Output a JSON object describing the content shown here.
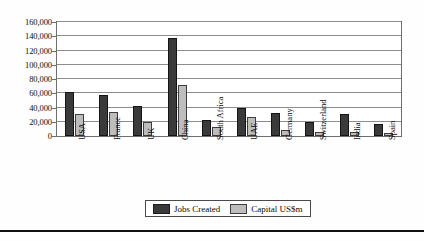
{
  "chart_data": {
    "type": "bar",
    "title": "",
    "subtitle": "",
    "xlabel": "",
    "ylabel": "",
    "ylim": [
      0,
      160000
    ],
    "ytick_step": 20000,
    "ytick_labels": [
      "0",
      "20,000",
      "40,000",
      "60,000",
      "80,000",
      "100,000",
      "120,000",
      "140,000",
      "160,000"
    ],
    "ytick_values": [
      0,
      20000,
      40000,
      60000,
      80000,
      100000,
      120000,
      140000,
      160000
    ],
    "grid": true,
    "grid_axis": "y",
    "legend_position": "bottom",
    "categories": [
      "USA",
      "France",
      "UK",
      "China",
      "South Africa",
      "UAE",
      "Germany",
      "Switzerland",
      "India",
      "Spain"
    ],
    "series": [
      {
        "name": "Jobs Created",
        "color": "#3a3a3a",
        "values": [
          62000,
          58000,
          42000,
          138000,
          22000,
          40000,
          33000,
          20000,
          31000,
          17000
        ]
      },
      {
        "name": "Capital US$m",
        "color": "#bdbdbd",
        "values": [
          31000,
          34000,
          19000,
          72000,
          12000,
          27000,
          8000,
          6000,
          5000,
          4000
        ]
      }
    ]
  },
  "legend": {
    "items": [
      {
        "label": "Jobs Created",
        "swatch": "dark-square-swatch"
      },
      {
        "label": "Capital US$m",
        "swatch": "light-square-swatch"
      }
    ]
  },
  "colors": {
    "series_jobs": "#3a3a3a",
    "series_capital": "#bdbdbd",
    "gridline": "#8d8d8d",
    "frame": "#6e6e6e",
    "rule": "#101010"
  }
}
